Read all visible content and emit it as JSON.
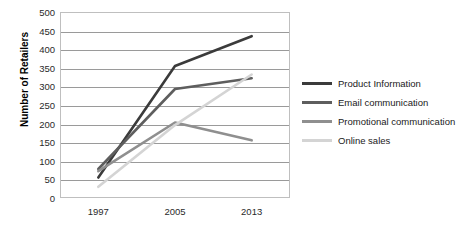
{
  "chart_data": {
    "type": "line",
    "title": "",
    "xlabel": "",
    "ylabel": "Number of Retailers",
    "categories": [
      "1997",
      "2005",
      "2013"
    ],
    "x": [
      1997,
      2005,
      2013
    ],
    "ylim": [
      0,
      500
    ],
    "yticks": [
      500,
      450,
      400,
      350,
      300,
      250,
      200,
      150,
      100,
      50,
      0
    ],
    "grid": true,
    "legend_position": "right",
    "series": [
      {
        "name": "Product Information",
        "color": "#3b3b3b",
        "values": [
          55,
          355,
          435
        ]
      },
      {
        "name": "Email communication",
        "color": "#5e5e5e",
        "values": [
          78,
          293,
          322
        ]
      },
      {
        "name": "Promotional communication",
        "color": "#8f8f8f",
        "values": [
          72,
          203,
          155
        ]
      },
      {
        "name": "Online sales",
        "color": "#d4d4d4",
        "values": [
          30,
          196,
          332
        ]
      }
    ]
  },
  "axis": {
    "y_title": "Number of Retailers"
  }
}
